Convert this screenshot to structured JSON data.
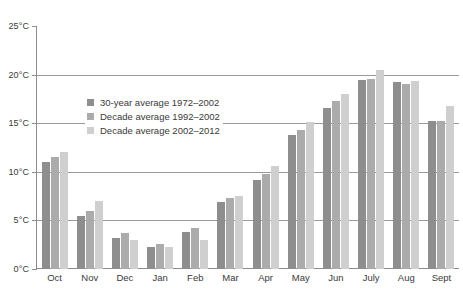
{
  "chart_data": {
    "type": "bar",
    "title": "",
    "xlabel": "",
    "ylabel": "",
    "ylim": [
      0,
      25
    ],
    "ytick_step": 5,
    "ytick_labels": [
      "0°C",
      "5°C",
      "10°C",
      "15°C",
      "20°C",
      "25°C"
    ],
    "ytick_values": [
      0,
      5,
      10,
      15,
      20,
      25
    ],
    "grid": "horizontal",
    "legend_position": "inside-upper-left",
    "categories": [
      "Oct",
      "Nov",
      "Dec",
      "Jan",
      "Feb",
      "Mar",
      "Apr",
      "May",
      "Jun",
      "July",
      "Aug",
      "Sept"
    ],
    "series": [
      {
        "name": "30-year average 1972–2002",
        "color": "#8e8e8e",
        "values": [
          11.0,
          5.5,
          3.2,
          2.3,
          3.8,
          6.9,
          9.2,
          13.8,
          16.6,
          19.4,
          19.2,
          15.2
        ]
      },
      {
        "name": "Decade average 1992–2002",
        "color": "#ababab",
        "values": [
          11.5,
          6.0,
          3.7,
          2.6,
          4.2,
          7.3,
          9.8,
          14.3,
          17.3,
          19.5,
          19.0,
          15.2
        ]
      },
      {
        "name": "Decade average 2002–2012",
        "color": "#cfcfcf",
        "values": [
          12.0,
          7.0,
          3.0,
          2.3,
          3.0,
          7.5,
          10.6,
          15.1,
          18.0,
          20.5,
          19.3,
          16.8
        ]
      }
    ]
  },
  "legend": {
    "items": [
      {
        "label": "30-year average 1972–2002"
      },
      {
        "label": "Decade average 1992–2002"
      },
      {
        "label": "Decade average 2002–2012"
      }
    ]
  },
  "cropped_title_strip": ""
}
